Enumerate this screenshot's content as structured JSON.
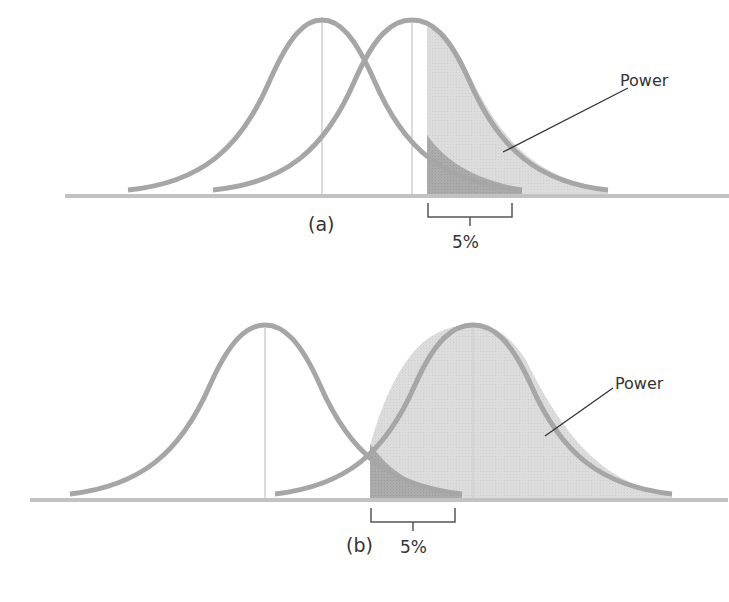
{
  "figure": {
    "panels": [
      {
        "id": "a",
        "label": "(a)",
        "annotation": "Power",
        "alpha_label": "5%",
        "description": "Two overlapping distributions close together; small power"
      },
      {
        "id": "b",
        "label": "(b)",
        "annotation": "Power",
        "alpha_label": "5%",
        "description": "Two distributions further apart; large power"
      }
    ]
  },
  "colors": {
    "curve": "#a6a6a6",
    "baseline": "#c2c2c2",
    "power_fill": "#dcdcdc",
    "alpha_fill": "#a9a9a9",
    "text": "#333333"
  }
}
